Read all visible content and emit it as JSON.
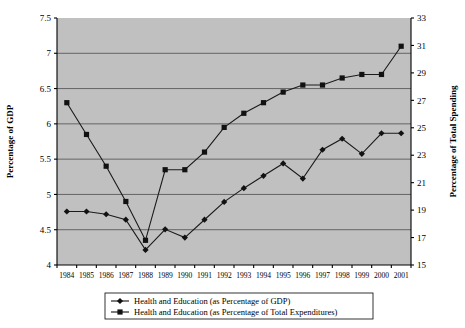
{
  "chart_data": {
    "type": "line",
    "title": "",
    "xlabel": "",
    "ylabel": "Percentage of GDP",
    "y2label": "Percentage of Total Spending",
    "grid": true,
    "legend_position": "bottom",
    "categories": [
      1984,
      1985,
      1986,
      1987,
      1988,
      1989,
      1990,
      1991,
      1992,
      1993,
      1994,
      1995,
      1996,
      1997,
      1998,
      1999,
      2000,
      2001
    ],
    "xtick_labels": [
      "1984",
      "1985",
      "1986",
      "1987",
      "1988",
      "1989",
      "1990",
      "1991",
      "1992",
      "1993",
      "1994",
      "1995",
      "1996",
      "1997",
      "1998",
      "1999",
      "2000",
      "2001"
    ],
    "ylim": [
      4,
      7.5
    ],
    "ytick_labels": [
      "4",
      "4.5",
      "5",
      "5.5",
      "6",
      "6.5",
      "7",
      "7.5"
    ],
    "yticks": [
      4,
      4.5,
      5,
      5.5,
      6,
      6.5,
      7,
      7.5
    ],
    "y2lim": [
      15,
      33
    ],
    "y2tick_labels": [
      "15",
      "17",
      "19",
      "21",
      "23",
      "25",
      "27",
      "29",
      "31",
      "33"
    ],
    "y2ticks": [
      15,
      17,
      19,
      21,
      23,
      25,
      27,
      29,
      31,
      33
    ],
    "series": [
      {
        "name": "Health and Education (as Percentage of GDP)",
        "axis": "right",
        "marker": "diamond",
        "color": "#111111",
        "values": [
          18.9,
          18.9,
          18.7,
          18.3,
          16.1,
          17.6,
          17.0,
          18.3,
          19.6,
          20.6,
          21.5,
          22.4,
          21.3,
          23.4,
          24.2,
          23.1,
          24.6,
          24.6
        ]
      },
      {
        "name": "Health and Education (as Percentage of Total Expenditures)",
        "axis": "left",
        "marker": "square",
        "color": "#111111",
        "values": [
          6.3,
          5.85,
          5.4,
          4.9,
          4.35,
          5.35,
          5.35,
          5.6,
          5.95,
          6.15,
          6.3,
          6.45,
          6.55,
          6.55,
          6.65,
          6.7,
          6.7,
          7.1
        ]
      }
    ],
    "legend": [
      {
        "label": "Health and Education (as Percentage of GDP)",
        "marker": "diamond"
      },
      {
        "label": "Health and Education (as Percentage of Total Expenditures)",
        "marker": "square"
      }
    ]
  }
}
